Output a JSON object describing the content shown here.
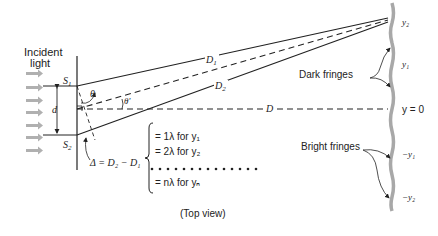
{
  "labels": {
    "incident_line1": "Incident",
    "incident_line2": "light",
    "s1": "S",
    "s1_sub": "1",
    "s2": "S",
    "s2_sub": "2",
    "d": "d",
    "theta": "θ",
    "theta_prime": "θ'",
    "D1": "D",
    "D1_sub": "1",
    "D2": "D",
    "D2_sub": "2",
    "D": "D",
    "delta": "Δ = D₂ − D₁",
    "dark_fringes": "Dark fringes",
    "bright_fringes": "Bright fringes",
    "y2": "y₂",
    "y1": "y₁",
    "y0": "y = 0",
    "neg_y1": "−y₁",
    "neg_y2": "−y₂",
    "top_view": "(Top view)"
  },
  "conditions": [
    "= 1λ for y₁",
    "= 2λ for y₂",
    "= nλ for yₙ"
  ],
  "colors": {
    "line": "#222222",
    "arrow": "#b0b0b0",
    "screen": "#a8a8a8"
  }
}
